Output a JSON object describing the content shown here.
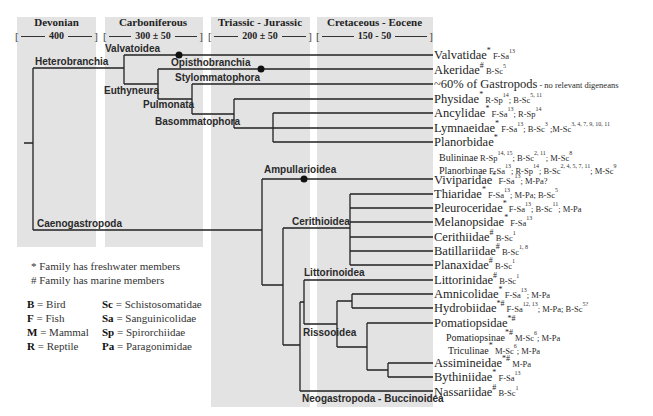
{
  "periods": [
    {
      "name": "Devonian",
      "range": "400",
      "open": "[",
      "close": "]"
    },
    {
      "name": "Carboniferous",
      "range": "300 ± 50",
      "open": "[",
      "close": "]"
    },
    {
      "name": "Triassic - Jurassic",
      "range": "200 ± 50",
      "open": "[",
      "close": "]"
    },
    {
      "name": "Cretaceous - Eocene",
      "range": "150 - 50",
      "open": "[",
      "close": "]"
    }
  ],
  "clades": {
    "heterobranchia": "Heterobranchia",
    "valvatoidea": "Valvatoidea",
    "opisthobranchia": "Opisthobranchia",
    "euthyneura": "Euthyneura",
    "stylommatophora": "Stylommatophora",
    "pulmonata": "Pulmonata",
    "basommatophora": "Basommatophora",
    "caenogastropoda": "Caenogastropoda",
    "ampullarioidea": "Ampullarioidea",
    "cerithioidea": "Cerithioidea",
    "littorinoidea": "Littorinoidea",
    "rissooidea": "Rissooidea",
    "neogastropoda": "Neogastropoda - Buccinoidea"
  },
  "taxa": [
    {
      "name": "Valvatidae",
      "mark": "*",
      "notes": [
        {
          "t": " F-Sa",
          "s": "13"
        }
      ]
    },
    {
      "name": "Akeridae",
      "mark": "#",
      "notes": [
        {
          "t": " B-Sc",
          "s": "5"
        }
      ]
    },
    {
      "name": "~60% of Gastropods",
      "mark": "",
      "notes": [
        {
          "t": " - no relevant digeneans",
          "s": ""
        }
      ]
    },
    {
      "name": "Physidae",
      "mark": "*",
      "notes": [
        {
          "t": " R-Sp",
          "s": "14"
        },
        {
          "t": "; B-Sc",
          "s": "5, 11"
        }
      ]
    },
    {
      "name": "Ancylidae",
      "mark": "*",
      "notes": [
        {
          "t": " F-Sa",
          "s": "13"
        },
        {
          "t": "; R-Sp",
          "s": "14"
        }
      ]
    },
    {
      "name": "Lymnaeidae",
      "mark": "*",
      "notes": [
        {
          "t": " F-Sa",
          "s": "13"
        },
        {
          "t": "; B-Sc",
          "s": "3"
        },
        {
          "t": " ;M-Sc",
          "s": "3, 4, 7, 9, 10, 11"
        }
      ]
    },
    {
      "name": "Planorbidae",
      "mark": "*",
      "notes": []
    },
    {
      "name": "Bulininae",
      "mark": "",
      "notes": [
        {
          "t": " R-Sp",
          "s": "14, 15"
        },
        {
          "t": "; B-Sc",
          "s": "2, 11"
        },
        {
          "t": "; M-Sc",
          "s": "8"
        }
      ]
    },
    {
      "name": "Planorbinae",
      "mark": "",
      "notes": [
        {
          "t": " F-Sa",
          "s": "13"
        },
        {
          "t": "; R-Sp",
          "s": "14"
        },
        {
          "t": "; B-Sc",
          "s": "2, 4, 5, 7, 11"
        },
        {
          "t": "; M-Sc",
          "s": "9"
        }
      ]
    },
    {
      "name": "Viviparidae",
      "mark": "*",
      "notes": [
        {
          "t": " F-Sa",
          "s": "13"
        },
        {
          "t": "; M-Pa?",
          "s": ""
        }
      ]
    },
    {
      "name": "Thiaridae",
      "mark": "*",
      "notes": [
        {
          "t": " F-Sa",
          "s": "13"
        },
        {
          "t": "; M-Pa; B-Sc",
          "s": "5"
        }
      ]
    },
    {
      "name": "Pleuroceridae",
      "mark": "*",
      "notes": [
        {
          "t": " F-Sa",
          "s": "13"
        },
        {
          "t": "; B-Sc",
          "s": "11"
        },
        {
          "t": "; M-Pa",
          "s": ""
        }
      ]
    },
    {
      "name": "Melanopsidae",
      "mark": "*",
      "notes": [
        {
          "t": " F-Sa",
          "s": "13"
        }
      ]
    },
    {
      "name": "Cerithiidae",
      "mark": "#",
      "notes": [
        {
          "t": " B-Sc",
          "s": "1"
        }
      ]
    },
    {
      "name": "Batillariidae",
      "mark": "#",
      "notes": [
        {
          "t": " B-Sc",
          "s": "1, 8"
        }
      ]
    },
    {
      "name": "Planaxidae",
      "mark": "#",
      "notes": [
        {
          "t": " B-Sc",
          "s": "1"
        }
      ]
    },
    {
      "name": "Littorinidae",
      "mark": "#",
      "notes": [
        {
          "t": " B-Sc",
          "s": "1"
        }
      ]
    },
    {
      "name": "Amnicolidae",
      "mark": "*",
      "notes": [
        {
          "t": " F-Sa",
          "s": "13"
        },
        {
          "t": "; M-Pa",
          "s": ""
        }
      ]
    },
    {
      "name": "Hydrobiidae",
      "mark": "*#",
      "notes": [
        {
          "t": " F-Sa",
          "s": "12, 13"
        },
        {
          "t": "; M-Pa; B-Sc",
          "s": "5?"
        }
      ]
    },
    {
      "name": "Pomatiopsidae",
      "mark": "*#",
      "notes": []
    },
    {
      "name": "Pomatiopsinae",
      "mark": "*#",
      "notes": [
        {
          "t": " M-Sc",
          "s": "6"
        },
        {
          "t": "; M-Pa",
          "s": ""
        }
      ]
    },
    {
      "name": "Triculinae",
      "mark": "*",
      "notes": [
        {
          "t": " M-Sc",
          "s": "6"
        },
        {
          "t": "; M-Pa",
          "s": ""
        }
      ]
    },
    {
      "name": "Assimineidae",
      "mark": "*#",
      "notes": [
        {
          "t": " M-Pa",
          "s": ""
        }
      ]
    },
    {
      "name": "Bythiniidae",
      "mark": "*",
      "notes": [
        {
          "t": " F-Sa",
          "s": "13"
        }
      ]
    },
    {
      "name": "Nassariidae",
      "mark": "#",
      "notes": [
        {
          "t": " B-Sc",
          "s": "1"
        }
      ]
    }
  ],
  "legend": {
    "freshwater": "* Family has freshwater members",
    "marine": "# Family has marine members",
    "hosts": [
      {
        "code": "B",
        "meaning": " = Bird"
      },
      {
        "code": "F",
        "meaning": " = Fish"
      },
      {
        "code": "M",
        "meaning": " = Mammal"
      },
      {
        "code": "R",
        "meaning": " = Reptile"
      }
    ],
    "parasites": [
      {
        "code": "Sc",
        "meaning": " = Schistosomatidae"
      },
      {
        "code": "Sa",
        "meaning": " = Sanguinicolidae"
      },
      {
        "code": "Sp",
        "meaning": " = Spirorchiidae"
      },
      {
        "code": "Pa",
        "meaning": " = Paragonimidae"
      }
    ]
  }
}
